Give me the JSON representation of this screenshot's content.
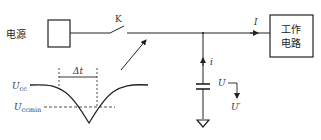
{
  "diagram": {
    "power_source": {
      "label": "电源"
    },
    "switch": {
      "label": "K"
    },
    "load": {
      "label_line1": "工作",
      "label_line2": "电路"
    },
    "current_main": {
      "label": "I"
    },
    "current_branch": {
      "label": "i"
    },
    "capacitor_voltage": {
      "label": "U",
      "label_after": "U",
      "prime": "′"
    },
    "waveform": {
      "upper_level": {
        "symbol": "U",
        "subscript": "cc"
      },
      "lower_level": {
        "symbol": "U",
        "subscript": "ccmin"
      },
      "interval": {
        "label": "Δt"
      }
    },
    "colors": {
      "stroke": "#222222",
      "text": "#333333",
      "background": "#ffffff"
    }
  }
}
